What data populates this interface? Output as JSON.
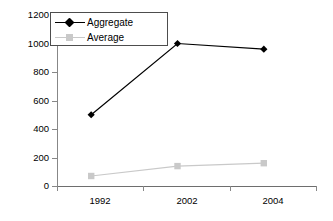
{
  "chart_data": {
    "type": "line",
    "title": "",
    "xlabel": "",
    "ylabel": "",
    "categories": [
      "1992",
      "2002",
      "2004"
    ],
    "ylim": [
      0,
      1200
    ],
    "yticks": [
      0,
      200,
      400,
      600,
      800,
      1000,
      1200
    ],
    "ytick_labels": [
      "0",
      "200",
      "400",
      "600",
      "800",
      "1000",
      "1200"
    ],
    "grid": false,
    "legend_position": "top-left",
    "series": [
      {
        "name": "Aggregate",
        "values": [
          500,
          1000,
          960
        ],
        "color": "#000000",
        "marker": "diamond"
      },
      {
        "name": "Average",
        "values": [
          70,
          140,
          160
        ],
        "color": "#c9c9c9",
        "marker": "square"
      }
    ]
  },
  "legend": {
    "entries": [
      {
        "label": "Aggregate"
      },
      {
        "label": "Average"
      }
    ]
  },
  "axis": {
    "y_tick_labels": [
      "1200",
      "1000",
      "800",
      "600",
      "400",
      "200",
      "0"
    ],
    "x_tick_labels": [
      "1992",
      "2002",
      "2004"
    ]
  },
  "colors": {
    "aggregate": "#000000",
    "average": "#c9c9c9",
    "axis": "#878787",
    "legend_border": "#4d4d4d",
    "background": "#ffffff"
  }
}
